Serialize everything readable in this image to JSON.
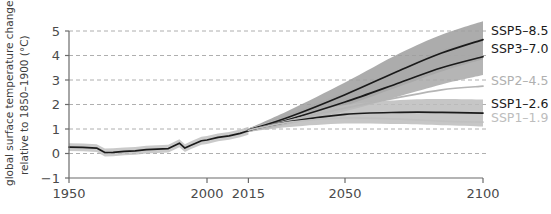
{
  "chart_data": {
    "type": "line",
    "title": "",
    "xlabel": "",
    "ylabel": "global surface temperature change relative to 1850–1900 (°C)",
    "ylabel_line1": "global surface temperature change",
    "ylabel_line2": "relative to 1850–1900 (°C)",
    "xlim": [
      1950,
      2100
    ],
    "ylim": [
      -1,
      5
    ],
    "x_ticks": [
      1950,
      2000,
      2015,
      2050,
      2100
    ],
    "x_tick_labels": [
      "1950",
      "2000",
      "2015",
      "2050",
      "2100"
    ],
    "y_ticks": [
      -1,
      0,
      1,
      2,
      3,
      4,
      5
    ],
    "y_tick_labels": [
      "−1",
      "0",
      "1",
      "2",
      "3",
      "4",
      "5"
    ],
    "grid": "horizontal-dashed",
    "legend_position": "right-outside",
    "historical": {
      "name": "historical",
      "color": "#1a1a1a",
      "band_color": "#bdbdbd",
      "x": [
        1950,
        1955,
        1960,
        1963,
        1966,
        1970,
        1974,
        1978,
        1982,
        1986,
        1990,
        1992,
        1994,
        1998,
        2000,
        2004,
        2008,
        2012,
        2015
      ],
      "values": [
        0.26,
        0.25,
        0.22,
        0.04,
        0.05,
        0.09,
        0.11,
        0.16,
        0.18,
        0.2,
        0.42,
        0.22,
        0.33,
        0.52,
        0.55,
        0.66,
        0.72,
        0.82,
        0.93
      ],
      "band_lower": [
        0.1,
        0.09,
        0.06,
        -0.12,
        -0.11,
        -0.07,
        -0.05,
        0.0,
        0.02,
        0.04,
        0.26,
        0.06,
        0.17,
        0.36,
        0.39,
        0.5,
        0.56,
        0.66,
        0.77
      ],
      "band_upper": [
        0.42,
        0.41,
        0.38,
        0.2,
        0.21,
        0.25,
        0.27,
        0.32,
        0.34,
        0.36,
        0.58,
        0.38,
        0.49,
        0.68,
        0.71,
        0.82,
        0.88,
        0.98,
        1.09
      ]
    },
    "series": [
      {
        "name": "SSP5–8.5",
        "label": "SSP5–8.5",
        "color": "#1a1a1a",
        "label_color": "#1a1a1a",
        "band_color": "#9e9e9e",
        "band_opacity": 0.85,
        "show_band": true,
        "x": [
          2015,
          2030,
          2050,
          2070,
          2085,
          2100
        ],
        "values": [
          0.95,
          1.5,
          2.4,
          3.4,
          4.1,
          4.65
        ],
        "band_lower": [
          0.88,
          1.25,
          1.95,
          2.75,
          3.35,
          3.85
        ],
        "band_upper": [
          1.02,
          1.78,
          2.9,
          4.1,
          4.85,
          5.4
        ],
        "label_x": 2100,
        "label_y": 4.65
      },
      {
        "name": "SSP3–7.0",
        "label": "SSP3–7.0",
        "color": "#1a1a1a",
        "label_color": "#1a1a1a",
        "band_color": "#a8a8a8",
        "band_opacity": 0.85,
        "show_band": true,
        "x": [
          2015,
          2030,
          2050,
          2070,
          2085,
          2100
        ],
        "values": [
          0.95,
          1.4,
          2.1,
          2.9,
          3.5,
          3.95
        ],
        "band_lower": [
          0.88,
          1.2,
          1.72,
          2.35,
          2.82,
          3.2
        ],
        "band_upper": [
          1.02,
          1.62,
          2.5,
          3.45,
          4.2,
          4.7
        ],
        "label_x": 2100,
        "label_y": 3.95
      },
      {
        "name": "SSP2–4.5",
        "label": "SSP2–4.5",
        "color": "#b5b5b5",
        "label_color": "#b0b0b0",
        "band_color": "#d0d0d0",
        "band_opacity": 0.0,
        "show_band": false,
        "x": [
          2015,
          2030,
          2050,
          2070,
          2085,
          2100
        ],
        "values": [
          0.95,
          1.35,
          1.85,
          2.3,
          2.6,
          2.75
        ],
        "band_lower": [
          0.88,
          1.15,
          1.5,
          1.85,
          2.1,
          2.2
        ],
        "band_upper": [
          1.02,
          1.55,
          2.2,
          2.8,
          3.15,
          3.35
        ],
        "label_x": 2100,
        "label_y": 2.75
      },
      {
        "name": "SSP1–2.6",
        "label": "SSP1–2.6",
        "color": "#1a1a1a",
        "label_color": "#1a1a1a",
        "band_color": "#bcbcbc",
        "band_opacity": 0.85,
        "show_band": true,
        "x": [
          2015,
          2030,
          2050,
          2070,
          2085,
          2100
        ],
        "values": [
          0.95,
          1.3,
          1.6,
          1.68,
          1.68,
          1.65
        ],
        "band_lower": [
          0.88,
          1.08,
          1.22,
          1.2,
          1.15,
          1.1
        ],
        "band_upper": [
          1.02,
          1.52,
          1.98,
          2.18,
          2.22,
          2.2
        ],
        "label_x": 2100,
        "label_y": 1.65
      },
      {
        "name": "SSP1–1.9",
        "label": "SSP1–1.9",
        "color": "#c0c0c0",
        "label_color": "#bdbdbd",
        "band_color": "#d8d8d8",
        "band_opacity": 0.0,
        "show_band": false,
        "x": [
          2015,
          2030,
          2050,
          2070,
          2085,
          2100
        ],
        "values": [
          0.95,
          1.28,
          1.45,
          1.4,
          1.32,
          1.28
        ],
        "band_lower": [
          0.88,
          1.05,
          1.08,
          0.95,
          0.85,
          0.8
        ],
        "band_upper": [
          1.02,
          1.5,
          1.82,
          1.85,
          1.8,
          1.78
        ],
        "label_x": 2100,
        "label_y": 1.28
      }
    ],
    "legend_entries": [
      {
        "label": "SSP5–8.5",
        "color": "#1a1a1a"
      },
      {
        "label": "SSP3–7.0",
        "color": "#1a1a1a"
      },
      {
        "label": "SSP2–4.5",
        "color": "#b0b0b0"
      },
      {
        "label": "SSP1–2.6",
        "color": "#1a1a1a"
      },
      {
        "label": "SSP1–1.9",
        "color": "#bdbdbd"
      }
    ],
    "colors": {
      "axis": "#6b6b6b",
      "grid": "#9a9a9a",
      "text": "#4a4a4a",
      "line_dark": "#1a1a1a",
      "band_gray": "#a8a8a8",
      "light_gray": "#bdbdbd"
    }
  }
}
